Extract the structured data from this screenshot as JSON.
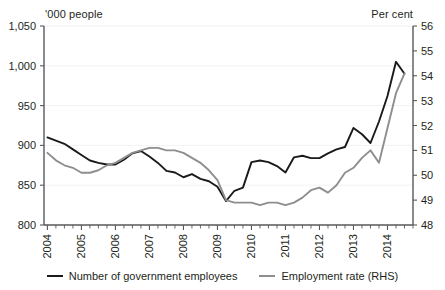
{
  "chart_data": {
    "type": "line",
    "title": "",
    "xlabel": "",
    "ylabel": "'000 people",
    "y2label": "Per cent",
    "grid": true,
    "legend_position": "bottom",
    "x": [
      2004.0,
      2004.25,
      2004.5,
      2004.75,
      2005.0,
      2005.25,
      2005.5,
      2005.75,
      2006.0,
      2006.25,
      2006.5,
      2006.75,
      2007.0,
      2007.25,
      2007.5,
      2007.75,
      2008.0,
      2008.25,
      2008.5,
      2008.75,
      2009.0,
      2009.25,
      2009.5,
      2009.75,
      2010.0,
      2010.25,
      2010.5,
      2010.75,
      2011.0,
      2011.25,
      2011.5,
      2011.75,
      2012.0,
      2012.25,
      2012.5,
      2012.75,
      2013.0,
      2013.25,
      2013.5,
      2013.75,
      2014.0,
      2014.25,
      2014.5
    ],
    "xtick_labels": [
      "2004",
      "2005",
      "2006",
      "2007",
      "2008",
      "2009",
      "2010",
      "2011",
      "2012",
      "2013",
      "2014"
    ],
    "xtick_values": [
      2004,
      2005,
      2006,
      2007,
      2008,
      2009,
      2010,
      2011,
      2012,
      2013,
      2014
    ],
    "xlim": [
      2003.9,
      2014.75
    ],
    "ylim": [
      800,
      1050
    ],
    "ytick_labels": [
      "800",
      "850",
      "900",
      "950",
      "1,000",
      "1,050"
    ],
    "ytick_values": [
      800,
      850,
      900,
      950,
      1000,
      1050
    ],
    "y2lim": [
      48,
      56
    ],
    "y2tick_labels": [
      "48",
      "49",
      "50",
      "51",
      "52",
      "53",
      "54",
      "55",
      "56"
    ],
    "y2tick_values": [
      48,
      49,
      50,
      51,
      52,
      53,
      54,
      55,
      56
    ],
    "series": [
      {
        "name": "Number of government employees",
        "axis": "left",
        "color": "#1a1a1a",
        "values": [
          910,
          906,
          902,
          895,
          888,
          881,
          878,
          876,
          876,
          882,
          890,
          893,
          886,
          878,
          868,
          866,
          860,
          864,
          858,
          855,
          848,
          830,
          843,
          847,
          879,
          881,
          879,
          874,
          866,
          885,
          887,
          884,
          884,
          890,
          895,
          898,
          922,
          914,
          903,
          930,
          962,
          1005,
          990
        ]
      },
      {
        "name": "Employment rate (RHS)",
        "axis": "right",
        "color": "#8e8e8e",
        "values": [
          50.9,
          50.6,
          50.4,
          50.3,
          50.1,
          50.1,
          50.2,
          50.4,
          50.5,
          50.7,
          50.9,
          51.0,
          51.1,
          51.1,
          51.0,
          51.0,
          50.9,
          50.7,
          50.5,
          50.2,
          49.8,
          49.0,
          48.9,
          48.9,
          48.9,
          48.8,
          48.9,
          48.9,
          48.8,
          48.9,
          49.1,
          49.4,
          49.5,
          49.3,
          49.6,
          50.1,
          50.3,
          50.7,
          51.0,
          50.5,
          51.9,
          53.3,
          54.1
        ]
      }
    ]
  },
  "legend": {
    "items": [
      {
        "label": "Number of government employees",
        "color": "#1a1a1a"
      },
      {
        "label": "Employment rate (RHS)",
        "color": "#8e8e8e"
      }
    ]
  },
  "axis_units": {
    "left": "'000 people",
    "right": "Per cent"
  }
}
